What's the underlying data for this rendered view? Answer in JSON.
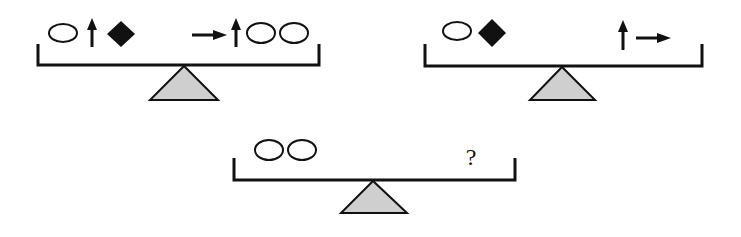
{
  "colors": {
    "ink": "#111111",
    "fulcrum_fill": "#cfcfcf",
    "background": "#ffffff"
  },
  "scales": [
    {
      "id": "scale-1",
      "balanced": true,
      "left_pan": [
        "oval",
        "up-arrow",
        "diamond"
      ],
      "right_pan": [
        "right-arrow",
        "up-arrow",
        "oval",
        "oval"
      ]
    },
    {
      "id": "scale-2",
      "balanced": true,
      "left_pan": [
        "oval",
        "diamond"
      ],
      "right_pan": [
        "up-arrow",
        "right-arrow"
      ]
    },
    {
      "id": "scale-3",
      "balanced": true,
      "left_pan": [
        "oval",
        "oval"
      ],
      "right_pan": [
        "question-mark"
      ],
      "question_text": "?"
    }
  ]
}
